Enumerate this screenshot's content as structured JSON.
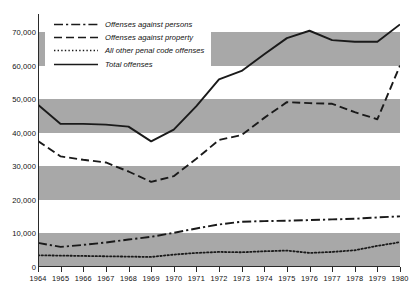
{
  "chart_data": {
    "type": "line",
    "title": "",
    "subtitle": "",
    "xlabel": "",
    "ylabel": "",
    "grid": false,
    "banded_background": true,
    "legend_position": "top-left",
    "x": [
      1964,
      1965,
      1966,
      1967,
      1968,
      1969,
      1970,
      1971,
      1972,
      1973,
      1974,
      1975,
      1976,
      1977,
      1978,
      1979,
      1980
    ],
    "categories": [
      "1964",
      "1965",
      "1966",
      "1967",
      "1968",
      "1969",
      "1970",
      "1971",
      "1972",
      "1973",
      "1974",
      "1975",
      "1976",
      "1977",
      "1978",
      "1979",
      "1980"
    ],
    "xlim": [
      1964,
      1980
    ],
    "ylim": [
      0,
      75500
    ],
    "yticks": [
      0,
      10000,
      20000,
      30000,
      40000,
      50000,
      60000,
      70000
    ],
    "ytick_labels": [
      "0",
      "10,000",
      "20,000",
      "30,000",
      "40,000",
      "50,000",
      "60,000",
      "70,000"
    ],
    "band_ranges": [
      [
        0,
        10000
      ],
      [
        20000,
        30000
      ],
      [
        40000,
        50000
      ],
      [
        60000,
        70000
      ]
    ],
    "band_color": "#a8a8a8",
    "line_color": "#1a1a1a",
    "series": [
      {
        "name": "Offenses against persons",
        "style": "dash-dot",
        "dasharray": "9,3,2.2,3",
        "values": [
          7200,
          6000,
          6600,
          7300,
          8200,
          9000,
          10200,
          11500,
          12700,
          13500,
          13700,
          13800,
          14000,
          14200,
          14400,
          14800,
          15100
        ]
      },
      {
        "name": "Offenses against property",
        "style": "dashed",
        "dasharray": "8,4",
        "values": [
          37600,
          33000,
          32000,
          31200,
          28500,
          25400,
          27100,
          32300,
          37900,
          39400,
          44500,
          49200,
          48900,
          48700,
          46200,
          44100,
          60100
        ]
      },
      {
        "name": "All other penal code offenses",
        "style": "dotted",
        "dasharray": "1.4,2.2",
        "values": [
          3500,
          3400,
          3300,
          3200,
          3100,
          3000,
          3700,
          4200,
          4500,
          4400,
          4700,
          4900,
          4200,
          4500,
          5000,
          6300,
          7400
        ]
      },
      {
        "name": "Total offenses",
        "style": "solid",
        "dasharray": "",
        "values": [
          48400,
          42700,
          42700,
          42500,
          41900,
          37500,
          41000,
          48000,
          56000,
          58500,
          63500,
          68300,
          70500,
          67700,
          67200,
          67200,
          72400
        ]
      }
    ]
  },
  "legend": {
    "items": [
      {
        "label": "Offenses against persons"
      },
      {
        "label": "Offenses against  property"
      },
      {
        "label": "All other penal code offenses"
      },
      {
        "label": "Total offenses"
      }
    ]
  }
}
